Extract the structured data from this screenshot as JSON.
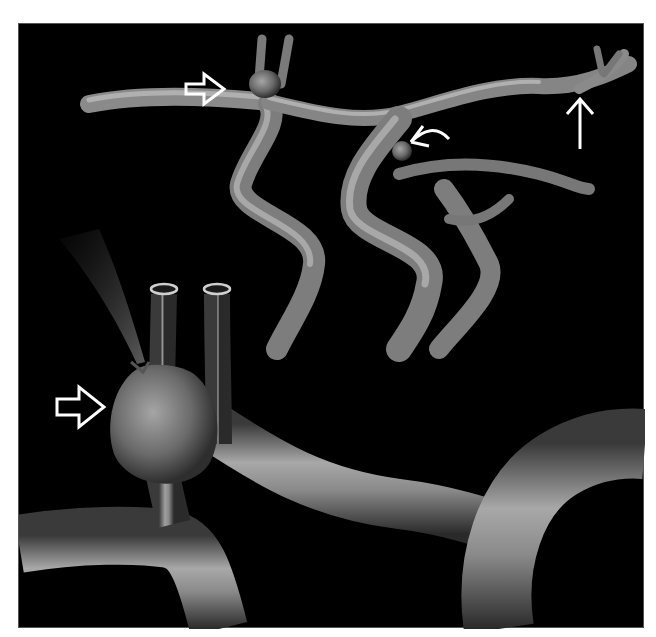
{
  "figure": {
    "background": "#000000",
    "page_background": "#ffffff",
    "vessel_color_light": "#b8b8b8",
    "vessel_color_mid": "#7a7a7a",
    "vessel_color_dark": "#2a2a2a",
    "arrow_color": "#ffffff",
    "panels": [
      {
        "name": "overview",
        "description": "cerebral arterial tree with aneurysms"
      },
      {
        "name": "magnified",
        "description": "ruptured bifurcation aneurysm with jet"
      }
    ],
    "annotations": [
      {
        "type": "open-arrow",
        "points_to": "aneurysm-top-left"
      },
      {
        "type": "curved-arrow",
        "points_to": "aneurysm-middle"
      },
      {
        "type": "line-arrow-up",
        "points_to": "vessel-top-right"
      },
      {
        "type": "open-arrow",
        "points_to": "aneurysm-magnified"
      }
    ]
  }
}
